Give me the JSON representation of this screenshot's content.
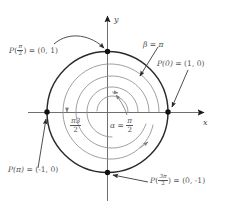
{
  "figure": {
    "type": "unit-circle-wrapping-function",
    "caption": "",
    "axes": {
      "x_label": "x",
      "y_label": "y",
      "origin": [
        107,
        112
      ],
      "x_axis_from": [
        28,
        112
      ],
      "x_axis_to": [
        209,
        112
      ],
      "y_axis_from": [
        107,
        200
      ],
      "y_axis_to": [
        107,
        11
      ]
    },
    "circle": {
      "center": [
        107,
        112
      ],
      "radius": 60,
      "stroke": "#2b2b2b",
      "stroke_width": 1.25,
      "description": "unit circle"
    },
    "spiral": {
      "stroke": "#8e8e8e",
      "stroke_width": 0.8,
      "turns": 2.6,
      "description": "inward spiral showing repeated wrapping of the real line onto the unit circle",
      "arrowheads": 3
    },
    "points": [
      {
        "name": "P-zero",
        "coords": [
          168,
          112
        ],
        "label_key": "p0"
      },
      {
        "name": "P-half-pi",
        "coords": [
          107,
          52
        ],
        "label_key": "p_half_pi"
      },
      {
        "name": "P-pi",
        "coords": [
          47,
          112
        ],
        "label_key": "p_pi"
      },
      {
        "name": "P-three-half-pi",
        "coords": [
          107,
          172
        ],
        "label_key": "p_three_half_pi"
      }
    ],
    "labels": {
      "p0": {
        "fn": "P(0)",
        "eq": "=",
        "value": "(1, 0)",
        "text": "P(0) = (1, 0)"
      },
      "p_half_pi": {
        "fn": "P",
        "arg_num": "π",
        "arg_den": "2",
        "eq": "=",
        "value": "(0, 1)",
        "text": "P(π/2) = (0, 1)"
      },
      "p_pi": {
        "fn": "P(π)",
        "eq": "=",
        "value": "(-1, 0)",
        "text": "P(π) = (-1, 0)"
      },
      "p_three_half_pi": {
        "fn": "P",
        "arg_num": "3π",
        "arg_den": "2",
        "eq": "=",
        "value": "(0, -1)",
        "text": "P(3π/2) = (0, -1)"
      },
      "beta": {
        "text": "β = π",
        "sym": "β",
        "eq": "=",
        "value": "π"
      },
      "alpha": {
        "sym": "α",
        "eq": "=",
        "num": "π",
        "den": "2",
        "text": "α = π/2"
      },
      "three_half_pi": {
        "num": "π3",
        "den": "2",
        "text": "π3/2"
      }
    },
    "colors": {
      "circle": "#2b2b2b",
      "spiral": "#8e8e8e",
      "axis": "#6f6f6f",
      "leader": "#6f6f6f",
      "text": "#555555",
      "point_fill": "#111111",
      "background": "#ffffff"
    }
  }
}
